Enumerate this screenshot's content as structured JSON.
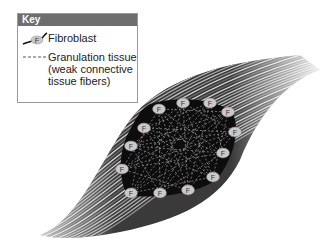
{
  "key": {
    "title": "Key",
    "items": [
      {
        "symbol": "fibroblast-cell",
        "label": "Fibroblast"
      },
      {
        "symbol": "dashed-line",
        "label": "Granulation tissue\n(weak connective\ntissue fibers)"
      }
    ]
  },
  "diagram": {
    "fibroblast_label": "F",
    "fibroblasts": [
      {
        "x": 159,
        "y": 109
      },
      {
        "x": 183,
        "y": 103
      },
      {
        "x": 210,
        "y": 103
      },
      {
        "x": 228,
        "y": 112
      },
      {
        "x": 235,
        "y": 132
      },
      {
        "x": 223,
        "y": 153
      },
      {
        "x": 213,
        "y": 177
      },
      {
        "x": 188,
        "y": 190
      },
      {
        "x": 160,
        "y": 193
      },
      {
        "x": 131,
        "y": 193
      },
      {
        "x": 122,
        "y": 169
      },
      {
        "x": 131,
        "y": 146
      },
      {
        "x": 144,
        "y": 128
      }
    ],
    "colors": {
      "wound": "#0d0d0d",
      "fiber_dark": "#2a2a2a",
      "fiber_light": "#d8d8d8",
      "cell": "#c9c9c9",
      "granulation": "#9a9a9a"
    }
  }
}
